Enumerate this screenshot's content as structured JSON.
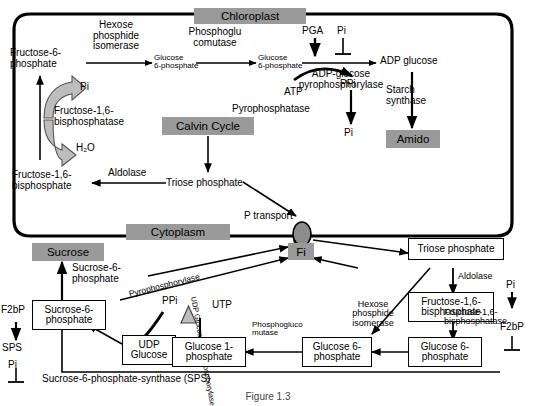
{
  "figure": {
    "caption": "Figure 1.3",
    "compartments": [
      {
        "name": "Chloroplast",
        "label": "Chloroplast"
      },
      {
        "name": "Cytoplasm",
        "label": "Cytoplasm"
      }
    ]
  },
  "colors": {
    "gray_box": "#9a9a9a",
    "stroke": "#000000",
    "background": "#ffffff",
    "thick_arrow_fill": "#bdbdbd"
  },
  "chloroplast": {
    "metabolites": {
      "fructose_6_phosphate": "Fructose-6-\nphosphate",
      "glucose_6_phosphate_a": "Glucose\n6-phosphate",
      "glucose_6_phosphate_b": "Glucose\n6-phosphate",
      "adp_glucose": "ADP glucose",
      "pga": "PGA",
      "pi_inhibit_agpase": "Pi",
      "atp": "ATP",
      "ppi": "PPi",
      "pi_from_ppi": "Pi",
      "pi_fbpase": "Pi",
      "water": "H₂O",
      "fructose_1_6_bisphosphate": "Fructose-1,6-\nbisphosphate",
      "triose_phosphate": "Triose phosphate"
    },
    "enzymes": {
      "hexose_phosphide_isomerase": "Hexose\nphosphide\nisomerase",
      "phosphoglucomutase": "Phosphoglu\ncomutase",
      "adp_glucose_pyrophosphorylase": "ADP-glucose\npyrophosphorylase",
      "pyrophosphatase": "Pyrophosphatase",
      "starch_synthase": "Starch\nsynthase",
      "fructose_1_6_bisphosphatase": "Fructose-1,6-\nbisphosphatase",
      "aldolase": "Aldolase"
    },
    "gray_labels": {
      "chloroplast": "Chloroplast",
      "calvin_cycle": "Calvin Cycle",
      "amido": "Amido"
    }
  },
  "membrane": {
    "transport_label": "P transport",
    "transporter_name": "phosphate-translocator"
  },
  "cytoplasm": {
    "gray_labels": {
      "cytoplasm": "Cytoplasm",
      "sucrose": "Sucrose",
      "fi": "Fi"
    },
    "metabolites": {
      "sucrose_6_phosphate_label": "Sucrose-6-\nphosphate",
      "sucrose_6_phosphate_box": "Sucrose-6-\nphosphate",
      "udp_glucose": "UDP\nGlucose",
      "glucose_1_phosphate": "Glucose\n1-phosphate",
      "glucose_6_phosphate": "Glucose\n6-phosphate",
      "triose_phosphate": "Triose phosphate",
      "fructose_1_6_bisphosphate": "Fructose-1,6-\nbisphosphate",
      "ppi": "PPi",
      "utp": "UTP",
      "pi_fbpase": "Pi"
    },
    "enzymes": {
      "pyrophosphorylase": "Pyrophosphorylase",
      "udp_glucose_pyrophosphorylase": "UDP Glucose\npyrophosphorylase",
      "phosphogluco_mutase": "Phosphogluco\nmutase",
      "hexose_phosphide_isomerase": "Hexose\nphosphide\nisomerase",
      "fructose_1_6_bisphosphatase": "Fructose-1,6-\nbisphosphatase",
      "sucrose_6_phosphate_synthase": "Sucrose-6-phosphate-synthase (SPS)"
    },
    "regulators": {
      "f2bp_left": "F2bP",
      "sps": "SPS",
      "pi_left": "Pi",
      "f2bp_right": "F2bP"
    }
  }
}
